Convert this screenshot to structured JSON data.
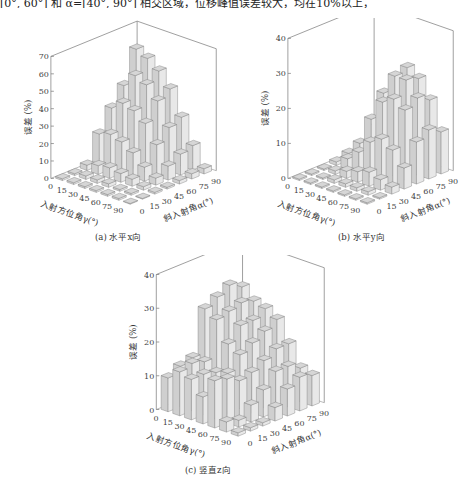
{
  "header_text": "[0°, 60°] 和 α=[40°, 90°] 相交区域，位移峰值误差较大，均在10%以上，",
  "axis_common": {
    "zlabel": "误差 (%)",
    "x_label": "入射方位角γ(°)",
    "y_label": "斜入射角α(°)",
    "gamma_ticks": [
      "0",
      "15",
      "30",
      "45",
      "60",
      "75",
      "90"
    ],
    "alpha_ticks": [
      "0",
      "15",
      "30",
      "45",
      "60",
      "75",
      "90"
    ]
  },
  "panels": [
    {
      "id": "a",
      "caption": "(a) 水平x向",
      "zticks": [
        "0",
        "10",
        "20",
        "30",
        "40",
        "50",
        "60",
        "70"
      ]
    },
    {
      "id": "b",
      "caption": "(b) 水平y向",
      "zticks": [
        "0",
        "10",
        "20",
        "30",
        "40"
      ]
    },
    {
      "id": "c",
      "caption": "(c) 竖直z向",
      "zticks": [
        "0",
        "10",
        "20",
        "30",
        "40"
      ]
    }
  ],
  "chart_data": [
    {
      "type": "bar3d",
      "title": "(a) 水平x向",
      "xlabel": "入射方位角γ(°)",
      "ylabel": "斜入射角α(°)",
      "zlabel": "误差 (%)",
      "x": [
        0,
        15,
        30,
        45,
        60,
        75,
        90
      ],
      "y": [
        0,
        15,
        30,
        45,
        60,
        75,
        90
      ],
      "zlim": [
        0,
        70
      ],
      "zticks": [
        0,
        10,
        20,
        30,
        40,
        50,
        60,
        70
      ],
      "values_note": "rows = γ (0..90), cols = α (0..90); estimated from bar heights",
      "values": [
        [
          1,
          1,
          3,
          18,
          30,
          40,
          58
        ],
        [
          1,
          2,
          5,
          20,
          35,
          48,
          55
        ],
        [
          1,
          2,
          6,
          18,
          33,
          45,
          50
        ],
        [
          1,
          2,
          5,
          14,
          28,
          38,
          42
        ],
        [
          1,
          1,
          4,
          8,
          18,
          25,
          28
        ],
        [
          1,
          1,
          2,
          4,
          8,
          12,
          14
        ],
        [
          0,
          0,
          1,
          1,
          2,
          3,
          3
        ]
      ]
    },
    {
      "type": "bar3d",
      "title": "(b) 水平y向",
      "xlabel": "入射方位角γ(°)",
      "ylabel": "斜入射角α(°)",
      "zlabel": "误差 (%)",
      "x": [
        0,
        15,
        30,
        45,
        60,
        75,
        90
      ],
      "y": [
        0,
        15,
        30,
        45,
        60,
        75,
        90
      ],
      "zlim": [
        0,
        40
      ],
      "zticks": [
        0,
        10,
        20,
        30,
        40
      ],
      "values_note": "rows = γ (0..90), cols = α (0..90); estimated from bar heights",
      "values": [
        [
          0,
          0,
          0,
          1,
          2,
          3,
          3
        ],
        [
          0,
          0,
          1,
          3,
          6,
          10,
          12
        ],
        [
          0,
          1,
          2,
          6,
          14,
          20,
          22
        ],
        [
          0,
          1,
          3,
          10,
          20,
          26,
          27
        ],
        [
          0,
          1,
          4,
          12,
          22,
          26,
          25
        ],
        [
          0,
          1,
          3,
          10,
          20,
          22,
          20
        ],
        [
          0,
          0,
          2,
          6,
          12,
          14,
          12
        ]
      ]
    },
    {
      "type": "bar3d",
      "title": "(c) 竖直z向",
      "xlabel": "入射方位角γ(°)",
      "ylabel": "斜入射角α(°)",
      "zlabel": "误差 (%)",
      "x": [
        0,
        15,
        30,
        45,
        60,
        75,
        90
      ],
      "y": [
        0,
        15,
        30,
        45,
        60,
        75,
        90
      ],
      "zlim": [
        0,
        40
      ],
      "zticks": [
        0,
        10,
        20,
        30,
        40
      ],
      "values_note": "rows = γ (0..90), cols = α (0..90); estimated from bar heights",
      "values": [
        [
          10,
          12,
          13,
          26,
          28,
          30,
          28
        ],
        [
          13,
          14,
          13,
          24,
          25,
          26,
          25
        ],
        [
          12,
          12,
          11,
          18,
          22,
          22,
          24
        ],
        [
          8,
          9,
          12,
          16,
          18,
          20,
          22
        ],
        [
          14,
          13,
          11,
          12,
          14,
          16,
          16
        ],
        [
          3,
          2,
          5,
          8,
          12,
          12,
          10
        ],
        [
          1,
          1,
          1,
          4,
          8,
          10,
          9
        ]
      ]
    }
  ]
}
